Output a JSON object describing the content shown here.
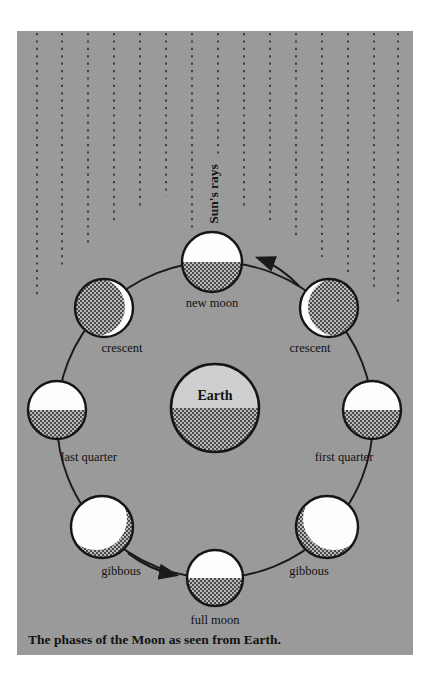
{
  "figure": {
    "caption": "The phases of the Moon as seen from Earth.",
    "sun_rays_label": "Sun's rays",
    "center_body_label": "Earth",
    "panel_color": "#9a9a9a",
    "page_color": "#ffffff",
    "ink_color": "#1a1a1a",
    "lit_color": "#fdfdfb",
    "earth_lit_color": "#cfcfcf",
    "dark_pattern": "stipple-halftone",
    "rays": {
      "count": 13,
      "style": "dotted-vertical",
      "direction": "downward-from-sun"
    },
    "orbit": {
      "direction": "counter-clockwise",
      "arrow_count": 2,
      "arrow_labels": [
        "orbit-arrow-toward-new-moon",
        "orbit-arrow-toward-full-moon"
      ]
    },
    "phases": [
      {
        "id": "new-moon",
        "label": "new moon",
        "cx": 212,
        "cy": 262,
        "r": 30,
        "lit_side": "top",
        "label_x": 212,
        "label_y": 303
      },
      {
        "id": "crescent-left",
        "label": "crescent",
        "cx": 104,
        "cy": 308,
        "r": 29,
        "lit_side": "right-sliver",
        "label_x": 122,
        "label_y": 349
      },
      {
        "id": "crescent-right",
        "label": "crescent",
        "cx": 329,
        "cy": 308,
        "r": 29,
        "lit_side": "left-sliver",
        "label_x": 310,
        "label_y": 349
      },
      {
        "id": "last-quarter",
        "label": "last quarter",
        "cx": 57,
        "cy": 410,
        "r": 29,
        "lit_side": "top",
        "label_x": 87,
        "label_y": 458
      },
      {
        "id": "first-quarter",
        "label": "first quarter",
        "cx": 372,
        "cy": 410,
        "r": 29,
        "lit_side": "top",
        "label_x": 346,
        "label_y": 458
      },
      {
        "id": "gibbous-left",
        "label": "gibbous",
        "cx": 102,
        "cy": 527,
        "r": 31,
        "lit_side": "mostly-lit-dark-lower-right",
        "label_x": 120,
        "label_y": 572
      },
      {
        "id": "gibbous-right",
        "label": "gibbous",
        "cx": 327,
        "cy": 527,
        "r": 31,
        "lit_side": "mostly-lit-dark-lower-left",
        "label_x": 309,
        "label_y": 572
      },
      {
        "id": "full-moon",
        "label": "full moon",
        "cx": 215,
        "cy": 578,
        "r": 28,
        "lit_side": "top",
        "label_x": 215,
        "label_y": 622
      }
    ],
    "earth": {
      "cx": 215,
      "cy": 408,
      "r": 44,
      "lit_side": "top",
      "label_x": 215,
      "label_y": 400
    }
  }
}
